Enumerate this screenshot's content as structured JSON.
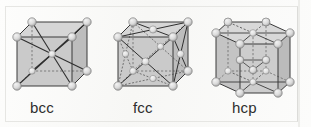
{
  "figure": {
    "background_color": "#fbfbfa",
    "frame_color": "#e6e6e3",
    "face_fill_color": "#c8c8c8",
    "face_fill_color_dark": "#b4b4b4",
    "face_fill_color_light": "#d8d8d8",
    "edge_color": "#3a3a3a",
    "hidden_edge_color": "#555555",
    "atom_color": "#d9d9d9",
    "atom_edge_color": "#7a7a7a"
  },
  "cells": [
    {
      "id": "bcc",
      "label": "bcc",
      "name": "body-centered-cubic",
      "shape": "cube",
      "atom_count": 9,
      "atom_positions": "8 cube corners + 1 body center",
      "diagonals": "four body diagonals drawn from each corner through the center"
    },
    {
      "id": "fcc",
      "label": "fcc",
      "name": "face-centered-cubic",
      "shape": "cube",
      "atom_count": 14,
      "atom_positions": "8 cube corners + 6 face centers",
      "diagonals": "face diagonals from each face-center atom to the four corners of that face"
    },
    {
      "id": "hcp",
      "label": "hcp",
      "name": "hexagonal-close-packed",
      "shape": "hexagonal-prism",
      "atom_count": 17,
      "atom_positions": "12 hexagon corners (6 top, 6 bottom) + 2 hexagon centers (top, bottom) + 3 midplane interior atoms",
      "diagonals": "spokes from hexagon centers to corners, vertical prism edges, midplane triangle"
    }
  ],
  "labels": {
    "bcc": "bcc",
    "fcc": "fcc",
    "hcp": "hcp"
  }
}
